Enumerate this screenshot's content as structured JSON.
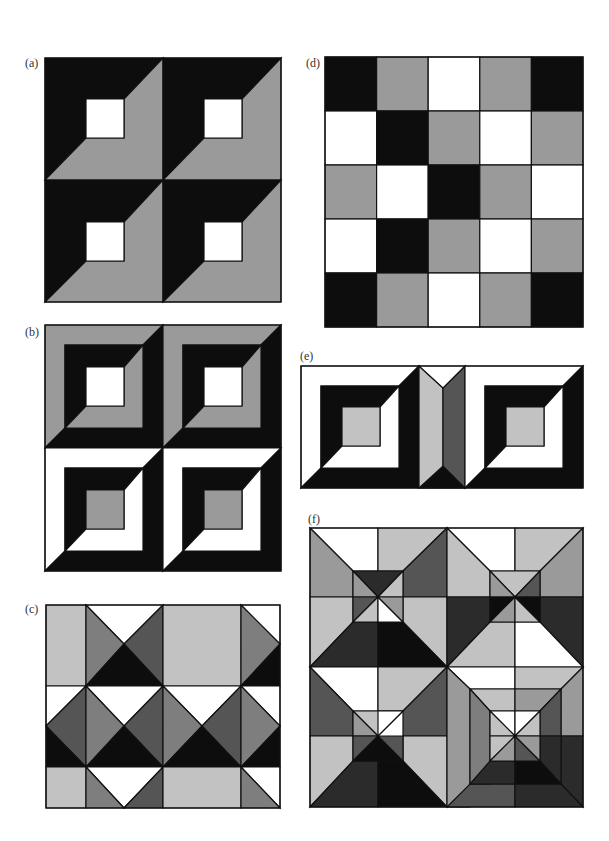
{
  "colors": {
    "B": "#0d0d0d",
    "G": "#9a9a9a",
    "L": "#c2c2c2",
    "M": "#7e7e7e",
    "D": "#555555",
    "S": "#2b2b2b",
    "W": "#ffffff"
  },
  "panels": [
    {
      "id": "a",
      "label": "(a)",
      "label_pos": [
        25,
        57
      ],
      "box": [
        45,
        58,
        236,
        244
      ],
      "view": [
        236,
        244
      ],
      "shapes": [
        {
          "c": "B",
          "p": "0,0 118,0 79,41 41,41 41,80 0,122"
        },
        {
          "c": "G",
          "p": "118,0 118,122 0,122 41,80 79,80 79,41"
        },
        {
          "c": "W",
          "p": "41,41 79,41 79,80 41,80"
        },
        {
          "c": "B",
          "p": "118,0 236,0 197,41 159,41 159,80 118,122"
        },
        {
          "c": "G",
          "p": "236,0 236,122 118,122 159,80 197,80 197,41"
        },
        {
          "c": "W",
          "p": "159,41 197,41 197,80 159,80"
        },
        {
          "c": "B",
          "p": "0,122 118,122 79,164 41,164 41,203 0,244"
        },
        {
          "c": "G",
          "p": "118,122 118,244 0,244 41,203 79,203 79,164"
        },
        {
          "c": "W",
          "p": "41,164 79,164 79,203 41,203"
        },
        {
          "c": "B",
          "p": "118,122 236,122 197,164 159,164 159,203 118,244"
        },
        {
          "c": "G",
          "p": "236,122 236,244 118,244 159,203 197,203 197,164"
        },
        {
          "c": "W",
          "p": "159,164 197,164 197,203 159,203"
        }
      ]
    },
    {
      "id": "b",
      "label": "(b)",
      "label_pos": [
        25,
        326
      ],
      "box": [
        45,
        325,
        236,
        246
      ],
      "view": [
        236,
        246
      ],
      "shapes": [
        {
          "c": "G",
          "p": "0,0 118,0 98,20 20,20 20,103 0,123"
        },
        {
          "c": "B",
          "p": "118,0 118,123 0,123 20,103 98,103 98,20"
        },
        {
          "c": "B",
          "p": "20,20 98,20 79,42 41,42 41,81 20,103"
        },
        {
          "c": "G",
          "p": "98,20 98,103 20,103 41,81 79,81 79,42"
        },
        {
          "c": "W",
          "p": "41,42 79,42 79,81 41,81"
        },
        {
          "c": "G",
          "p": "118,0 236,0 216,20 138,20 138,103 118,123"
        },
        {
          "c": "B",
          "p": "236,0 236,123 118,123 138,103 216,103 216,20"
        },
        {
          "c": "B",
          "p": "138,20 216,20 197,42 159,42 159,81 138,103"
        },
        {
          "c": "G",
          "p": "216,20 216,103 138,103 159,81 197,81 197,42"
        },
        {
          "c": "W",
          "p": "159,42 197,42 197,81 159,81"
        },
        {
          "c": "W",
          "p": "0,123 118,123 98,143 20,143 20,226 0,246"
        },
        {
          "c": "B",
          "p": "118,123 118,246 0,246 20,226 98,226 98,143"
        },
        {
          "c": "B",
          "p": "20,143 98,143 79,165 41,165 41,204 20,226"
        },
        {
          "c": "W",
          "p": "98,143 98,226 20,226 41,204 79,204 79,165"
        },
        {
          "c": "G",
          "p": "41,165 79,165 79,204 41,204"
        },
        {
          "c": "W",
          "p": "118,123 236,123 216,143 138,143 138,226 118,246"
        },
        {
          "c": "B",
          "p": "236,123 236,246 118,246 138,226 216,226 216,143"
        },
        {
          "c": "B",
          "p": "138,143 216,143 197,165 159,165 159,204 138,226"
        },
        {
          "c": "W",
          "p": "216,143 216,226 138,226 159,204 197,204 197,165"
        },
        {
          "c": "G",
          "p": "159,165 197,165 197,204 159,204"
        }
      ]
    },
    {
      "id": "c",
      "label": "(c)",
      "label_pos": [
        25,
        603
      ],
      "box": [
        46,
        605,
        234,
        203
      ],
      "view": [
        234,
        203
      ],
      "shapes": [
        {
          "c": "L",
          "p": "0,0 40,0 40,81 0,81"
        },
        {
          "c": "W",
          "p": "40,0 117,0 78,39"
        },
        {
          "c": "M",
          "p": "40,0 78,39 40,81"
        },
        {
          "c": "D",
          "p": "117,0 117,81 78,39"
        },
        {
          "c": "B",
          "p": "40,81 78,39 117,81"
        },
        {
          "c": "L",
          "p": "117,0 195,0 195,81 117,81"
        },
        {
          "c": "W",
          "p": "195,0 234,0 234,39"
        },
        {
          "c": "M",
          "p": "195,0 234,39 195,81"
        },
        {
          "c": "B",
          "p": "195,81 234,39 234,81"
        },
        {
          "c": "W",
          "p": "0,81 40,81 0,121"
        },
        {
          "c": "D",
          "p": "40,81 0,121 40,162"
        },
        {
          "c": "B",
          "p": "0,121 40,162 0,162"
        },
        {
          "c": "W",
          "p": "40,81 117,81 78,121"
        },
        {
          "c": "M",
          "p": "40,81 78,121 40,162"
        },
        {
          "c": "D",
          "p": "117,81 117,162 78,121"
        },
        {
          "c": "B",
          "p": "40,162 78,121 117,162"
        },
        {
          "c": "W",
          "p": "117,81 195,81 156,121"
        },
        {
          "c": "M",
          "p": "117,81 156,121 117,162"
        },
        {
          "c": "D",
          "p": "195,81 195,162 156,121"
        },
        {
          "c": "B",
          "p": "117,162 156,121 195,162"
        },
        {
          "c": "W",
          "p": "195,81 234,81 234,121"
        },
        {
          "c": "M",
          "p": "195,81 234,121 195,162"
        },
        {
          "c": "B",
          "p": "195,162 234,121 234,162"
        },
        {
          "c": "L",
          "p": "0,162 40,162 40,203 0,203"
        },
        {
          "c": "W",
          "p": "40,162 117,162 78,203"
        },
        {
          "c": "M",
          "p": "40,162 78,203 40,203"
        },
        {
          "c": "D",
          "p": "117,162 117,203 78,203"
        },
        {
          "c": "L",
          "p": "117,162 195,162 195,203 117,203"
        },
        {
          "c": "W",
          "p": "195,162 234,162 234,203"
        },
        {
          "c": "M",
          "p": "195,162 234,203 195,203"
        }
      ]
    },
    {
      "id": "d",
      "label": "(d)",
      "label_pos": [
        306,
        57
      ],
      "box": [
        325,
        57,
        258,
        270
      ],
      "view": [
        258,
        270
      ],
      "grid": [
        [
          "B",
          "G",
          "W",
          "G",
          "B"
        ],
        [
          "W",
          "B",
          "G",
          "W",
          "G"
        ],
        [
          "G",
          "W",
          "B",
          "G",
          "W"
        ],
        [
          "W",
          "B",
          "G",
          "W",
          "G"
        ],
        [
          "B",
          "G",
          "W",
          "G",
          "B"
        ]
      ]
    },
    {
      "id": "e",
      "label": "(e)",
      "label_pos": [
        300,
        350
      ],
      "box": [
        301,
        366,
        282,
        122
      ],
      "view": [
        282,
        122
      ],
      "shapes": [
        {
          "c": "W",
          "p": "0,0 118,0 98,20 20,20 20,102 0,122"
        },
        {
          "c": "B",
          "p": "118,0 118,122 0,122 20,102 98,102 98,20"
        },
        {
          "c": "B",
          "p": "20,20 98,20 79,41 41,41 41,80 20,102"
        },
        {
          "c": "W",
          "p": "98,20 98,102 20,102 41,80 79,80 79,41"
        },
        {
          "c": "L",
          "p": "41,41 79,41 79,80 41,80"
        },
        {
          "c": "L",
          "p": "118,0 142,22 142,122 118,122"
        },
        {
          "c": "D",
          "p": "142,22 164,0 164,122 142,122"
        },
        {
          "c": "W",
          "p": "118,0 164,0 142,22"
        },
        {
          "c": "B",
          "p": "118,122 142,100 164,122"
        },
        {
          "c": "W",
          "p": "164,0 282,0 262,20 184,20 184,102 164,122"
        },
        {
          "c": "B",
          "p": "282,0 282,122 164,122 184,102 262,102 262,20"
        },
        {
          "c": "B",
          "p": "184,20 262,20 243,41 205,41 205,80 184,102"
        },
        {
          "c": "W",
          "p": "262,20 262,102 184,102 205,80 243,80 243,41"
        },
        {
          "c": "L",
          "p": "205,41 243,41 243,80 205,80"
        }
      ]
    },
    {
      "id": "f",
      "label": "(f)",
      "label_pos": [
        308,
        513
      ],
      "box": [
        310,
        528,
        273,
        279
      ],
      "view": [
        273,
        279
      ],
      "shapes": [
        {
          "c": "W",
          "p": "0,0 68,0 68,43 43,43"
        },
        {
          "c": "L",
          "p": "68,0 137,0 93,43 68,43"
        },
        {
          "c": "G",
          "p": "0,0 43,43 43,69 0,69"
        },
        {
          "c": "L",
          "p": "0,69 43,69 43,94 0,139"
        },
        {
          "c": "D",
          "p": "137,0 137,69 93,69 93,43"
        },
        {
          "c": "L",
          "p": "137,69 137,139 93,94 93,69"
        },
        {
          "c": "S",
          "p": "0,139 43,94 68,94 68,139"
        },
        {
          "c": "B",
          "p": "68,94 93,94 137,139 68,139"
        },
        {
          "c": "S",
          "p": "43,43 93,43 68,69"
        },
        {
          "c": "G",
          "p": "43,43 68,69 43,69"
        },
        {
          "c": "L",
          "p": "93,43 93,69 68,69"
        },
        {
          "c": "D",
          "p": "43,69 68,69 43,94"
        },
        {
          "c": "L",
          "p": "43,94 68,69 68,94"
        },
        {
          "c": "W",
          "p": "68,69 93,94 68,94"
        },
        {
          "c": "G",
          "p": "93,69 93,94 68,69"
        },
        {
          "c": "W",
          "p": "137,0 205,0 205,43 180,43"
        },
        {
          "c": "L",
          "p": "205,0 273,0 230,43 205,43"
        },
        {
          "c": "L",
          "p": "137,0 180,43 180,69 137,69"
        },
        {
          "c": "S",
          "p": "137,69 180,69 180,94 137,139"
        },
        {
          "c": "G",
          "p": "273,0 273,69 230,69 230,43"
        },
        {
          "c": "S",
          "p": "273,69 273,139 230,94 230,69"
        },
        {
          "c": "L",
          "p": "137,139 180,94 205,94 205,139"
        },
        {
          "c": "W",
          "p": "205,94 230,94 273,139 205,139"
        },
        {
          "c": "L",
          "p": "180,43 230,43 205,69"
        },
        {
          "c": "G",
          "p": "180,43 205,69 180,69"
        },
        {
          "c": "D",
          "p": "230,43 230,69 205,69"
        },
        {
          "c": "B",
          "p": "180,69 205,69 180,94"
        },
        {
          "c": "G",
          "p": "180,94 205,69 205,94"
        },
        {
          "c": "L",
          "p": "205,69 230,94 205,94"
        },
        {
          "c": "B",
          "p": "230,69 230,94 205,69"
        },
        {
          "c": "W",
          "p": "0,139 68,139 68,183 43,183"
        },
        {
          "c": "L",
          "p": "68,139 137,139 93,183 68,183"
        },
        {
          "c": "D",
          "p": "0,139 43,183 43,208 0,208"
        },
        {
          "c": "L",
          "p": "0,208 43,208 43,233 0,279"
        },
        {
          "c": "D",
          "p": "137,139 137,208 93,208 93,183"
        },
        {
          "c": "L",
          "p": "137,208 137,279 93,233 93,208"
        },
        {
          "c": "S",
          "p": "0,279 43,233 68,233 68,279"
        },
        {
          "c": "B",
          "p": "68,233 93,233 137,279 68,279"
        },
        {
          "c": "L",
          "p": "43,183 93,183 68,208"
        },
        {
          "c": "G",
          "p": "43,183 68,208 43,208"
        },
        {
          "c": "W",
          "p": "68,183 93,183 68,208"
        },
        {
          "c": "D",
          "p": "43,208 68,208 43,233"
        },
        {
          "c": "B",
          "p": "43,233 68,208 93,233"
        },
        {
          "c": "D",
          "p": "93,208 93,233 68,208"
        },
        {
          "c": "W",
          "p": "137,139 205,139 205,161 160,161"
        },
        {
          "c": "L",
          "p": "205,139 273,139 251,161 205,161"
        },
        {
          "c": "G",
          "p": "137,139 160,161 160,279 137,279"
        },
        {
          "c": "G",
          "p": "273,139 273,208 251,208 251,161"
        },
        {
          "c": "S",
          "p": "273,208 273,279 251,256 251,208"
        },
        {
          "c": "D",
          "p": "137,279 160,256 205,256 205,279"
        },
        {
          "c": "S",
          "p": "205,256 251,256 273,279 205,279"
        },
        {
          "c": "L",
          "p": "160,161 205,161 205,183 180,183"
        },
        {
          "c": "G",
          "p": "205,161 251,161 230,183 205,183"
        },
        {
          "c": "M",
          "p": "160,161 180,183 180,256 160,256"
        },
        {
          "c": "D",
          "p": "251,161 251,208 230,208 230,183"
        },
        {
          "c": "S",
          "p": "251,208 251,256 230,233 230,208"
        },
        {
          "c": "S",
          "p": "160,256 180,233 205,233 205,256"
        },
        {
          "c": "B",
          "p": "205,233 230,233 251,256 205,256"
        },
        {
          "c": "W",
          "p": "180,183 205,183 205,208"
        },
        {
          "c": "W",
          "p": "205,183 230,183 205,208"
        },
        {
          "c": "L",
          "p": "230,183 230,208 205,208"
        },
        {
          "c": "L",
          "p": "180,183 205,208 180,208"
        },
        {
          "c": "L",
          "p": "180,208 205,208 180,233"
        },
        {
          "c": "G",
          "p": "180,233 205,208 205,233"
        },
        {
          "c": "D",
          "p": "205,208 230,233 205,233"
        },
        {
          "c": "G",
          "p": "230,208 230,233 205,208"
        }
      ]
    }
  ]
}
